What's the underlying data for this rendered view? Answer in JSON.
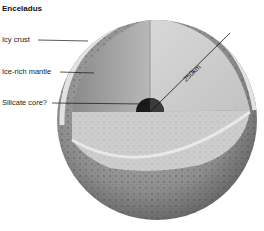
{
  "title": "Enceladus",
  "labels": {
    "icy_crust": "Icy crust",
    "ice_rich_mantle": "Ice-rich mantle",
    "silicate_core": "Silicate core?"
  },
  "radius_label": "250km",
  "colors": {
    "background": "#ffffff",
    "surface": "#9a9a9a",
    "crust": "#c8c8c8",
    "mantle_left": "#a8a8a8",
    "mantle_right": "#d4d4d4",
    "floor": "#cfcfcf",
    "core": "#1a1a1a"
  }
}
